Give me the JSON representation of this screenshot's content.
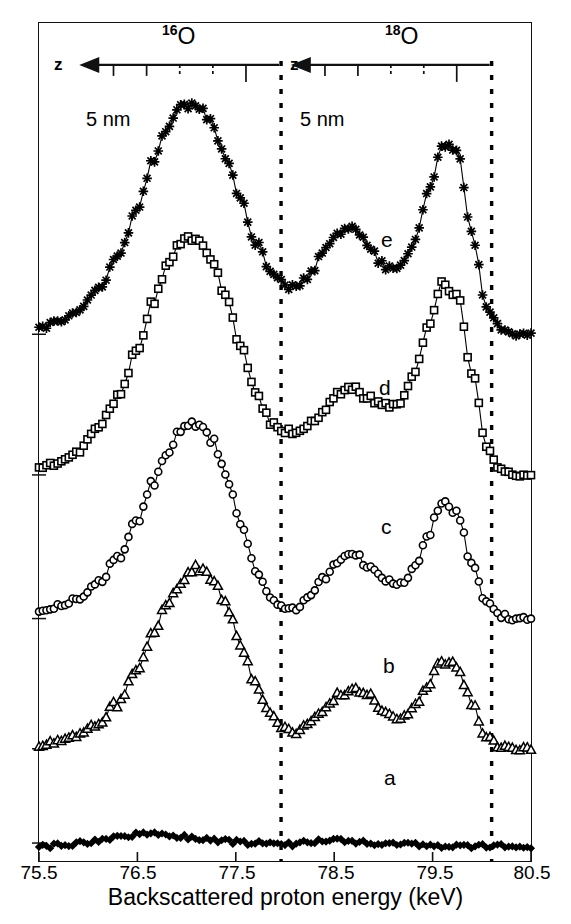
{
  "figure": {
    "xaxis_title": "Backscattered proton energy (keV)",
    "xtick_labels": [
      "75.5",
      "76.5",
      "77.5",
      "78.5",
      "79.5",
      "80.5"
    ],
    "xtick_values": [
      75.5,
      76.5,
      77.5,
      78.5,
      79.5,
      80.5
    ],
    "isotope_left": "16",
    "isotope_left_symbol": "O",
    "isotope_right": "18",
    "isotope_right_symbol": "O",
    "depth_axis_label": "z",
    "depth_scale_label": "5 nm",
    "curve_labels": [
      "a",
      "b",
      "c",
      "d",
      "e"
    ]
  },
  "chart_data": {
    "type": "line",
    "title": "",
    "subtitle": "",
    "xlabel": "Backscattered proton energy (keV)",
    "ylabel": "",
    "xlim": [
      75.5,
      80.5
    ],
    "ylim": [
      0,
      5.6
    ],
    "grid": false,
    "legend": "inline-curve-letters",
    "annotations": [
      {
        "text": "16O",
        "kind": "isotope-region-label",
        "x_keV": 77.1
      },
      {
        "text": "18O",
        "kind": "isotope-region-label",
        "x_keV": 79.35
      },
      {
        "text": "z",
        "kind": "depth-axis-name",
        "x_keV": 75.95
      },
      {
        "text": "z",
        "kind": "depth-axis-name",
        "x_keV": 78.1
      },
      {
        "text": "5 nm",
        "kind": "depth-scale",
        "x_keV": 76.3
      },
      {
        "text": "5 nm",
        "kind": "depth-scale",
        "x_keV": 78.45
      }
    ],
    "vertical_dashed_lines_keV": [
      77.96,
      80.1
    ],
    "depth_arrows": [
      {
        "isotope": "16O",
        "direction": "left",
        "x_start_keV": 77.94,
        "x_end_keV": 75.95,
        "tick_count": 5,
        "tick_spacing_label": "5 nm"
      },
      {
        "isotope": "18O",
        "direction": "left",
        "x_start_keV": 80.08,
        "x_end_keV": 78.1,
        "tick_count": 5,
        "tick_spacing_label": "5 nm"
      }
    ],
    "series": [
      {
        "name": "a",
        "marker": "filled-diamond",
        "baseline": 0.12,
        "x": [
          75.5,
          75.65,
          75.8,
          75.95,
          76.1,
          76.25,
          76.4,
          76.55,
          76.7,
          76.85,
          77.0,
          77.15,
          77.3,
          77.45,
          77.6,
          77.75,
          77.9,
          78.05,
          78.2,
          78.35,
          78.5,
          78.65,
          78.8,
          78.95,
          79.1,
          79.25,
          79.4,
          79.55,
          79.7,
          79.85,
          80.0,
          80.15,
          80.3,
          80.5
        ],
        "y": [
          0.1,
          0.1,
          0.11,
          0.12,
          0.13,
          0.15,
          0.17,
          0.18,
          0.18,
          0.17,
          0.16,
          0.15,
          0.14,
          0.13,
          0.12,
          0.12,
          0.11,
          0.11,
          0.12,
          0.13,
          0.14,
          0.13,
          0.12,
          0.12,
          0.11,
          0.11,
          0.11,
          0.1,
          0.1,
          0.1,
          0.1,
          0.1,
          0.1,
          0.1
        ]
      },
      {
        "name": "b",
        "marker": "open-triangle",
        "baseline": 0.75,
        "x": [
          75.5,
          75.7,
          75.9,
          76.1,
          76.3,
          76.5,
          76.65,
          76.8,
          76.95,
          77.1,
          77.25,
          77.4,
          77.55,
          77.7,
          77.85,
          77.95,
          78.1,
          78.25,
          78.4,
          78.55,
          78.7,
          78.85,
          79.0,
          79.15,
          79.3,
          79.45,
          79.6,
          79.75,
          79.9,
          80.05,
          80.2,
          80.35,
          80.5
        ],
        "y": [
          0.78,
          0.8,
          0.84,
          0.92,
          1.05,
          1.28,
          1.5,
          1.72,
          1.88,
          1.96,
          1.9,
          1.72,
          1.45,
          1.18,
          0.98,
          0.9,
          0.86,
          0.92,
          1.02,
          1.12,
          1.16,
          1.1,
          1.0,
          0.96,
          1.02,
          1.18,
          1.34,
          1.3,
          1.05,
          0.82,
          0.76,
          0.75,
          0.75
        ]
      },
      {
        "name": "c",
        "marker": "open-circle",
        "baseline": 1.62,
        "x": [
          75.5,
          75.7,
          75.9,
          76.1,
          76.3,
          76.5,
          76.65,
          76.8,
          76.95,
          77.1,
          77.25,
          77.4,
          77.55,
          77.7,
          77.85,
          77.95,
          78.1,
          78.25,
          78.4,
          78.55,
          78.7,
          78.85,
          79.0,
          79.15,
          79.3,
          79.45,
          79.6,
          79.75,
          79.9,
          80.05,
          80.2,
          80.35,
          80.5
        ],
        "y": [
          1.66,
          1.7,
          1.76,
          1.86,
          2.02,
          2.28,
          2.52,
          2.74,
          2.88,
          2.92,
          2.82,
          2.58,
          2.26,
          1.96,
          1.76,
          1.7,
          1.68,
          1.76,
          1.9,
          2.02,
          2.06,
          1.98,
          1.88,
          1.84,
          1.94,
          2.18,
          2.4,
          2.32,
          1.98,
          1.72,
          1.64,
          1.62,
          1.62
        ]
      },
      {
        "name": "d",
        "marker": "open-square",
        "baseline": 2.58,
        "x": [
          75.5,
          75.7,
          75.9,
          76.1,
          76.3,
          76.5,
          76.65,
          76.8,
          76.95,
          77.1,
          77.25,
          77.4,
          77.55,
          77.7,
          77.85,
          77.95,
          78.1,
          78.25,
          78.4,
          78.55,
          78.7,
          78.85,
          79.0,
          79.15,
          79.3,
          79.45,
          79.6,
          79.75,
          79.9,
          80.05,
          80.2,
          80.35,
          80.5
        ],
        "y": [
          2.62,
          2.66,
          2.74,
          2.88,
          3.1,
          3.42,
          3.72,
          3.98,
          4.14,
          4.16,
          4.02,
          3.76,
          3.44,
          3.14,
          2.94,
          2.88,
          2.86,
          2.92,
          3.02,
          3.12,
          3.16,
          3.1,
          3.04,
          3.06,
          3.24,
          3.56,
          3.86,
          3.78,
          3.26,
          2.76,
          2.62,
          2.58,
          2.58
        ]
      },
      {
        "name": "e",
        "marker": "star",
        "baseline": 3.52,
        "x": [
          75.5,
          75.7,
          75.9,
          76.1,
          76.3,
          76.5,
          76.65,
          76.8,
          76.95,
          77.1,
          77.25,
          77.4,
          77.55,
          77.7,
          77.85,
          77.95,
          78.1,
          78.25,
          78.4,
          78.55,
          78.7,
          78.85,
          79.0,
          79.15,
          79.3,
          79.45,
          79.6,
          79.75,
          79.9,
          80.05,
          80.2,
          80.35,
          80.5
        ],
        "y": [
          3.56,
          3.6,
          3.68,
          3.82,
          4.04,
          4.36,
          4.66,
          4.9,
          5.04,
          5.06,
          4.94,
          4.7,
          4.42,
          4.14,
          3.94,
          3.86,
          3.82,
          3.92,
          4.08,
          4.2,
          4.24,
          4.12,
          3.98,
          3.96,
          4.12,
          4.46,
          4.8,
          4.74,
          4.18,
          3.7,
          3.56,
          3.52,
          3.52
        ]
      }
    ]
  }
}
